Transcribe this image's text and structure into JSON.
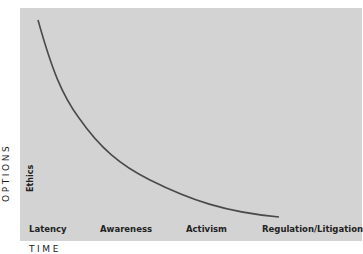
{
  "diagram": {
    "y_axis_label": "OPTIONS",
    "x_axis_label": "TIME",
    "y_marker": "Ethics",
    "x_stages": [
      "Latency",
      "Awareness",
      "Activism",
      "Regulation/Litigation"
    ],
    "curve_description": "Decreasing convex curve: options narrow over time",
    "colors": {
      "background": "#d3d3d3",
      "curve": "#4a4a4a",
      "text": "#222222"
    }
  }
}
